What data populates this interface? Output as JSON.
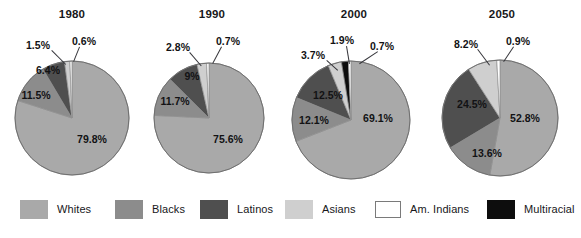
{
  "chart_data": {
    "type": "pie",
    "title": "",
    "legend_position": "bottom",
    "categories": [
      "Whites",
      "Blacks",
      "Latinos",
      "Asians",
      "Am. Indians",
      "Multiracial"
    ],
    "colors": {
      "Whites": "#a9a9a9",
      "Blacks": "#8c8c8c",
      "Latinos": "#4f4f4f",
      "Asians": "#cfcfcf",
      "Am. Indians": "#ffffff",
      "Multiracial": "#0d0d0d"
    },
    "charts": [
      {
        "title": "1980",
        "slices": [
          {
            "name": "Whites",
            "value": 79.8,
            "label": "79.8%"
          },
          {
            "name": "Blacks",
            "value": 11.5,
            "label": "11.5%"
          },
          {
            "name": "Latinos",
            "value": 6.4,
            "label": "6.4%"
          },
          {
            "name": "Asians",
            "value": 1.5,
            "label": "1.5%"
          },
          {
            "name": "Am. Indians",
            "value": 0.6,
            "label": "0.6%"
          },
          {
            "name": "Multiracial",
            "value": 0.0,
            "label": ""
          }
        ]
      },
      {
        "title": "1990",
        "slices": [
          {
            "name": "Whites",
            "value": 75.6,
            "label": "75.6%"
          },
          {
            "name": "Blacks",
            "value": 11.7,
            "label": "11.7%"
          },
          {
            "name": "Latinos",
            "value": 9.0,
            "label": "9%"
          },
          {
            "name": "Asians",
            "value": 2.8,
            "label": "2.8%"
          },
          {
            "name": "Am. Indians",
            "value": 0.7,
            "label": "0.7%"
          },
          {
            "name": "Multiracial",
            "value": 0.0,
            "label": ""
          }
        ]
      },
      {
        "title": "2000",
        "slices": [
          {
            "name": "Whites",
            "value": 69.1,
            "label": "69.1%"
          },
          {
            "name": "Blacks",
            "value": 12.1,
            "label": "12.1%"
          },
          {
            "name": "Latinos",
            "value": 12.5,
            "label": "12.5%"
          },
          {
            "name": "Asians",
            "value": 3.7,
            "label": "3.7%"
          },
          {
            "name": "Multiracial",
            "value": 1.9,
            "label": "1.9%"
          },
          {
            "name": "Am. Indians",
            "value": 0.7,
            "label": "0.7%"
          }
        ]
      },
      {
        "title": "2050",
        "slices": [
          {
            "name": "Whites",
            "value": 52.8,
            "label": "52.8%"
          },
          {
            "name": "Blacks",
            "value": 13.6,
            "label": "13.6%"
          },
          {
            "name": "Latinos",
            "value": 24.5,
            "label": "24.5%"
          },
          {
            "name": "Asians",
            "value": 8.2,
            "label": "8.2%"
          },
          {
            "name": "Am. Indians",
            "value": 0.9,
            "label": "0.9%"
          },
          {
            "name": "Multiracial",
            "value": 0.0,
            "label": ""
          }
        ]
      }
    ]
  },
  "legend": {
    "items": [
      {
        "label": "Whites",
        "swatch": "whites-swatch",
        "color": "#a9a9a9",
        "border": "none",
        "x": 20,
        "lx": 55
      },
      {
        "label": "Blacks",
        "swatch": "blacks-swatch",
        "color": "#8c8c8c",
        "border": "none",
        "x": 115,
        "lx": 150
      },
      {
        "label": "Latinos",
        "swatch": "latinos-swatch",
        "color": "#4f4f4f",
        "border": "none",
        "x": 200,
        "lx": 235
      },
      {
        "label": "Asians",
        "swatch": "asians-swatch",
        "color": "#cfcfcf",
        "border": "none",
        "x": 285,
        "lx": 320
      },
      {
        "label": "Am. Indians",
        "swatch": "am-indians-swatch",
        "color": "#ffffff",
        "border": "#7a7a7a",
        "x": 375,
        "lx": 410
      },
      {
        "label": "Multiracial",
        "swatch": "multiracial-swatch",
        "color": "#0d0d0d",
        "border": "none",
        "x": 487,
        "lx": 522
      }
    ]
  },
  "layout": {
    "pies": [
      {
        "cx": 72,
        "cy": 118,
        "r": 57,
        "title_x": 72,
        "title_y": 8
      },
      {
        "cx": 209,
        "cy": 118,
        "r": 55,
        "title_x": 212,
        "title_y": 8
      },
      {
        "cx": 351,
        "cy": 120,
        "r": 59,
        "title_x": 354,
        "title_y": 8
      },
      {
        "cx": 500,
        "cy": 118,
        "r": 58,
        "title_x": 502,
        "title_y": 8
      }
    ],
    "labels": [
      [
        {
          "text": "79.8%",
          "x": 92,
          "y": 139,
          "inside": true
        },
        {
          "text": "11.5%",
          "x": 36,
          "y": 95,
          "inside": true
        },
        {
          "text": "6.4%",
          "x": 48,
          "y": 70,
          "inside": true
        },
        {
          "text": "1.5%",
          "x": 38,
          "y": 45,
          "inside": false,
          "lead": {
            "x1": 52,
            "y1": 50,
            "x2": 66,
            "y2": 64
          }
        },
        {
          "text": "0.6%",
          "x": 84,
          "y": 41,
          "inside": false,
          "lead": {
            "x1": 80,
            "y1": 47,
            "x2": 74,
            "y2": 62
          }
        }
      ],
      [
        {
          "text": "75.6%",
          "x": 228,
          "y": 139,
          "inside": true
        },
        {
          "text": "11.7%",
          "x": 175,
          "y": 101,
          "inside": true
        },
        {
          "text": "9%",
          "x": 192,
          "y": 76,
          "inside": true
        },
        {
          "text": "2.8%",
          "x": 178,
          "y": 47,
          "inside": false,
          "lead": {
            "x1": 190,
            "y1": 52,
            "x2": 202,
            "y2": 66
          }
        },
        {
          "text": "0.7%",
          "x": 228,
          "y": 41,
          "inside": false,
          "lead": {
            "x1": 222,
            "y1": 47,
            "x2": 213,
            "y2": 64
          }
        }
      ],
      [
        {
          "text": "69.1%",
          "x": 378,
          "y": 118,
          "inside": true
        },
        {
          "text": "12.1%",
          "x": 314,
          "y": 120,
          "inside": true
        },
        {
          "text": "12.5%",
          "x": 328,
          "y": 95,
          "inside": true
        },
        {
          "text": "3.7%",
          "x": 313,
          "y": 55,
          "inside": false,
          "lead": {
            "x1": 327,
            "y1": 60,
            "x2": 338,
            "y2": 70
          }
        },
        {
          "text": "1.9%",
          "x": 342,
          "y": 40,
          "inside": false,
          "lead": {
            "x1": 347,
            "y1": 46,
            "x2": 350,
            "y2": 64
          }
        },
        {
          "text": "0.7%",
          "x": 382,
          "y": 46,
          "inside": false,
          "lead": {
            "x1": 378,
            "y1": 52,
            "x2": 360,
            "y2": 64
          }
        }
      ],
      [
        {
          "text": "52.8%",
          "x": 525,
          "y": 118,
          "inside": true
        },
        {
          "text": "13.6%",
          "x": 487,
          "y": 153,
          "inside": true
        },
        {
          "text": "24.5%",
          "x": 472,
          "y": 104,
          "inside": true
        },
        {
          "text": "8.2%",
          "x": 466,
          "y": 44,
          "inside": false,
          "lead": {
            "x1": 478,
            "y1": 49,
            "x2": 490,
            "y2": 65
          }
        },
        {
          "text": "0.9%",
          "x": 518,
          "y": 41,
          "inside": false,
          "lead": {
            "x1": 514,
            "y1": 47,
            "x2": 504,
            "y2": 62
          }
        }
      ]
    ]
  }
}
